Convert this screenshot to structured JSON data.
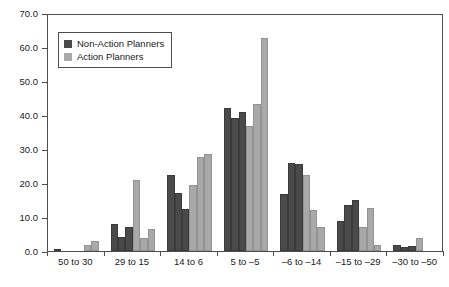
{
  "chart_data": {
    "type": "bar",
    "title": "",
    "subtitle": "",
    "xlabel": "",
    "ylabel": "",
    "ylim": [
      0.0,
      70.0
    ],
    "ytick_labels": [
      "0.0",
      "10.0",
      "20.0",
      "30.0",
      "40.0",
      "50.0",
      "60.0",
      "70.0"
    ],
    "ytick_values": [
      0,
      10,
      20,
      30,
      40,
      50,
      60,
      70
    ],
    "grid": false,
    "legend_position": "upper-left",
    "categories": [
      "50 to 30",
      "29 to 15",
      "14 to 6",
      "5 to –5",
      "–6 to –14",
      "–15 to –29",
      "–30 to –50"
    ],
    "bars_per_group": 6,
    "series": [
      {
        "name": "Non-Action Planners",
        "color": "#4a4a4a",
        "values": [
          [
            0.3,
            0.0,
            0.0
          ],
          [
            8.0,
            4.2,
            7.2
          ],
          [
            22.5,
            17.1,
            12.3
          ],
          [
            42.0,
            39.0,
            40.8
          ],
          [
            16.7,
            26.0,
            25.6
          ],
          [
            8.9,
            13.4,
            15.1
          ],
          [
            1.8,
            1.1,
            1.6
          ]
        ]
      },
      {
        "name": "Action Planners",
        "color": "#a9a9a9",
        "values": [
          [
            0.0,
            1.7,
            2.8
          ],
          [
            20.8,
            3.9,
            6.6
          ],
          [
            19.3,
            27.7,
            28.5
          ],
          [
            36.8,
            43.2,
            62.6
          ],
          [
            22.5,
            12.1,
            7.0
          ],
          [
            7.0,
            12.6,
            1.8
          ],
          [
            3.8,
            0.0,
            0.0
          ]
        ]
      }
    ],
    "group_bar_order": [
      "series-0",
      "series-0",
      "series-0",
      "series-1",
      "series-1",
      "series-1"
    ]
  },
  "legend": {
    "items": [
      {
        "label": "Non-Action Planners",
        "color": "#4a4a4a"
      },
      {
        "label": "Action Planners",
        "color": "#a9a9a9"
      }
    ]
  }
}
